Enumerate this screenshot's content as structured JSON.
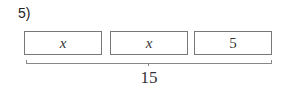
{
  "problem": {
    "number_label": "5)",
    "boxes": [
      {
        "value": "x",
        "type": "variable"
      },
      {
        "value": "x",
        "type": "variable"
      },
      {
        "value": "5",
        "type": "constant"
      }
    ],
    "total": "15"
  }
}
